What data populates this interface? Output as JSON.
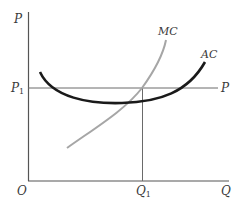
{
  "diagram": {
    "axes": {
      "y_label": "P",
      "x_label": "Q",
      "origin_label": "O"
    },
    "price_line": {
      "left_label_main": "P",
      "left_label_sub": "1",
      "right_label": "P"
    },
    "quantity": {
      "label_main": "Q",
      "label_sub": "1"
    },
    "curves": [
      {
        "name": "MC",
        "label": "MC",
        "color": "#a6a6a6"
      },
      {
        "name": "AC",
        "label": "AC",
        "color": "#1a1a1a"
      }
    ],
    "colors": {
      "axis": "#555555",
      "guide": "#6a6a6a",
      "mc": "#a6a6a6",
      "ac": "#1a1a1a"
    }
  }
}
